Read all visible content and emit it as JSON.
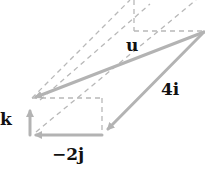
{
  "diagram": {
    "labels": {
      "u": "u",
      "four_i": "4i",
      "k": "k",
      "minus_two_j": "−2j"
    },
    "colors": {
      "vector": "#b3b3b3",
      "dashed": "#b8b8b8",
      "text": "#111111"
    }
  }
}
